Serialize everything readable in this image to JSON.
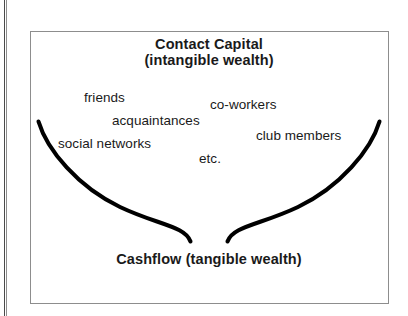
{
  "figure": {
    "background_color": "#ffffff",
    "frame_border_color": "#8d8d8d",
    "curve_color": "#000000",
    "text_color": "#1a1a1a"
  },
  "heading": {
    "line1": "Contact Capital",
    "line2": "(intangible wealth)"
  },
  "footer": {
    "line1": "Cashflow",
    "line2": "(tangible wealth)"
  },
  "nodes": [
    {
      "label": "friends"
    },
    {
      "label": "co-workers"
    },
    {
      "label": "acquaintances"
    },
    {
      "label": "club members"
    },
    {
      "label": "social networks"
    },
    {
      "label": "etc."
    }
  ]
}
